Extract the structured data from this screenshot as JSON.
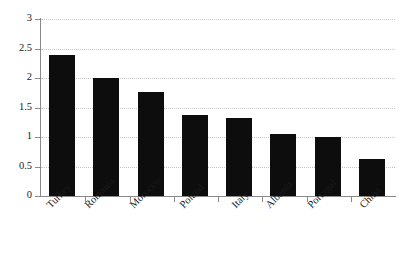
{
  "chart_data": {
    "type": "bar",
    "title": "",
    "subtitle": "",
    "xlabel": "",
    "ylabel": "",
    "categories": [
      "Turkey",
      "Romania",
      "Morocco",
      "Poland",
      "Italy",
      "Albania",
      "Portugal",
      "China"
    ],
    "values": [
      2.39,
      2.0,
      1.77,
      1.37,
      1.32,
      1.05,
      1.0,
      0.62
    ],
    "ylim": [
      0,
      3
    ],
    "ytick_labels": [
      "0",
      "0.5",
      "1",
      "1.5",
      "2",
      "2.5",
      "3"
    ],
    "ytick_values": [
      0,
      0.5,
      1,
      1.5,
      2,
      2.5,
      3
    ],
    "grid": true,
    "grid_axis": "y",
    "grid_style": "dotted",
    "legend": false,
    "legend_position": "none",
    "annotations": []
  },
  "style": {
    "bar_color": "#0d0d0d",
    "grid_color": "#c8c8c8",
    "axis_color": "#8a8a8a",
    "text_color": "#1a1a1a",
    "background": "#ffffff",
    "label_rotation_deg": -45
  }
}
